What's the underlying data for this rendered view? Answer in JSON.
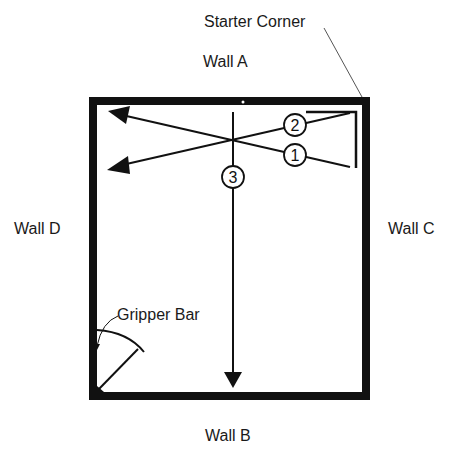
{
  "diagram": {
    "type": "room-carpet-installation-plan",
    "labels": {
      "starter_corner": "Starter Corner",
      "wall_a": "Wall A",
      "wall_b": "Wall B",
      "wall_c": "Wall C",
      "wall_d": "Wall D",
      "gripper_bar": "Gripper Bar"
    },
    "steps": [
      {
        "number": "1",
        "description": "Stretch from starter corner toward Wall D (lower diagonal)"
      },
      {
        "number": "2",
        "description": "Stretch from starter corner toward Wall D (upper diagonal)"
      },
      {
        "number": "3",
        "description": "Stretch from Wall A toward Wall B"
      }
    ],
    "step_labels": {
      "one": "1",
      "two": "2",
      "three": "3"
    },
    "colors": {
      "ink": "#111111",
      "background": "#ffffff"
    }
  }
}
